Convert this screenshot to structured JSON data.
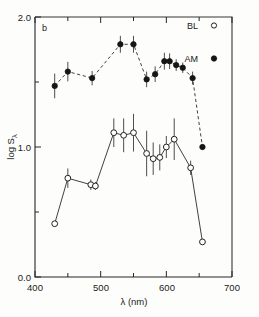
{
  "figure": {
    "panel_label": "b",
    "background_color": "#fdfdfc",
    "foreground_color": "#1a1a1a"
  },
  "axes": {
    "y_title": "log S",
    "y_title_subscript": "λ",
    "x_title": "λ (nm)",
    "y_ticks_major": [
      "2.0",
      "1.0",
      "0.0"
    ],
    "x_ticks_major": [
      "400",
      "500",
      "600",
      "700"
    ]
  },
  "legend": {
    "position": "top-right",
    "entries": [
      {
        "label": "BL",
        "marker": "open-circle",
        "marker_color": "#ffffff",
        "edge_color": "#222222"
      },
      {
        "label": "AM",
        "marker": "filled-circle",
        "marker_color": "#151515",
        "edge_color": "#151515"
      }
    ]
  },
  "chart_data": {
    "type": "scatter",
    "title": "",
    "subtitle": "",
    "panel": "b",
    "xlabel": "λ (nm)",
    "ylabel": "log Sλ",
    "xlim": [
      400,
      700
    ],
    "ylim": [
      0.0,
      2.0
    ],
    "x_ticks_major": [
      400,
      500,
      600,
      700
    ],
    "x_ticks_minor": [
      450,
      550,
      650
    ],
    "y_ticks_major": [
      0.0,
      1.0,
      2.0
    ],
    "y_ticks_minor": [
      0.5,
      1.5
    ],
    "grid": false,
    "legend_position": "top-right",
    "series": [
      {
        "name": "AM",
        "marker": "filled-circle",
        "linestyle": "dashed",
        "color": "#151515",
        "x": [
          430,
          450,
          487,
          530,
          550,
          570,
          583,
          597,
          605,
          615,
          625,
          640,
          655
        ],
        "y": [
          1.47,
          1.58,
          1.53,
          1.79,
          1.79,
          1.52,
          1.56,
          1.66,
          1.66,
          1.63,
          1.61,
          1.53,
          1.0
        ],
        "yerr": [
          0.095,
          0.075,
          0.055,
          0.065,
          0.065,
          0.06,
          0.06,
          0.065,
          0.06,
          0.045,
          0.04,
          0.05,
          0.0
        ]
      },
      {
        "name": "BL",
        "marker": "open-circle",
        "linestyle": "solid",
        "color": "#ffffff",
        "x": [
          430,
          450,
          485,
          492,
          520,
          535,
          550,
          570,
          580,
          590,
          600,
          612,
          637,
          655
        ],
        "y": [
          0.41,
          0.76,
          0.71,
          0.7,
          1.11,
          1.09,
          1.11,
          0.95,
          0.91,
          0.92,
          1.0,
          1.06,
          0.84,
          0.27
        ],
        "yerr": [
          0.0,
          0.075,
          0.04,
          0.03,
          0.11,
          0.13,
          0.145,
          0.175,
          0.125,
          0.1,
          0.085,
          0.16,
          0.055,
          0.0
        ]
      }
    ]
  }
}
